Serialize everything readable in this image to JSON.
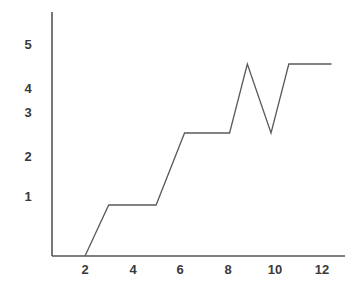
{
  "chart_data": {
    "type": "line",
    "title": "",
    "subtitle": "",
    "xlabel": "",
    "ylabel": "",
    "xlim": [
      0,
      13.2
    ],
    "ylim": [
      0,
      5.6
    ],
    "grid": false,
    "legend": null,
    "legend_position": "none",
    "xticks": [
      2,
      4,
      6,
      8,
      10,
      12
    ],
    "xtick_labels": [
      "2",
      "4",
      "6",
      "8",
      "10",
      "12"
    ],
    "yticks": [
      1,
      2,
      3,
      4,
      5
    ],
    "ytick_labels": [
      "1",
      "2",
      "3",
      "4",
      "5"
    ],
    "series": [
      {
        "name": "series-1",
        "color": "#595959",
        "x": [
          2.0,
          3.0,
          5.0,
          6.2,
          8.1,
          8.85,
          9.85,
          10.6,
          12.4
        ],
        "y": [
          0.0,
          0.85,
          0.85,
          2.05,
          2.05,
          3.2,
          2.05,
          3.2,
          3.2
        ]
      }
    ],
    "annotations": []
  },
  "axes": {
    "axis_color": "#555555",
    "line_color": "#595959",
    "tick_text_color": "#3a3a3a",
    "background": "#ffffff"
  }
}
